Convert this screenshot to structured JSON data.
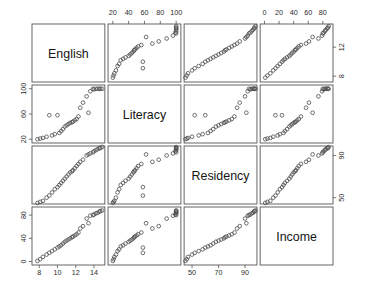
{
  "figure": {
    "type": "scatterplot-matrix",
    "background": "#ffffff",
    "point_color": "#4d4d4d",
    "frame_color": "#555555",
    "point_symbol": "open-circle"
  },
  "chart_data": {
    "type": "scatter",
    "title": "",
    "subtitle": "",
    "xlabel": "",
    "ylabel": "",
    "grid": false,
    "legend": "none",
    "matrix": true,
    "n_variables": 4,
    "n_points": 32,
    "variables": [
      {
        "name": "English",
        "ticks": [
          8,
          10,
          12,
          14
        ],
        "range": [
          7.2,
          15.2
        ],
        "axis_sides": [
          "bottom",
          "right"
        ]
      },
      {
        "name": "Literacy",
        "ticks": [
          20,
          40,
          60,
          80,
          100
        ],
        "range": [
          14,
          106
        ],
        "axis_sides": [
          "top",
          "left"
        ]
      },
      {
        "name": "Residency",
        "ticks": [
          50,
          70,
          90
        ],
        "range": [
          44,
          99
        ],
        "axis_sides": [
          "bottom",
          "right"
        ]
      },
      {
        "name": "Income",
        "ticks": [
          0,
          20,
          40,
          60,
          80
        ],
        "range": [
          -6,
          94
        ],
        "axis_sides": [
          "top",
          "left"
        ]
      }
    ],
    "columns": [
      "English",
      "Literacy",
      "Residency",
      "Income"
    ],
    "rows": [
      "English",
      "Literacy",
      "Residency",
      "Income"
    ],
    "observations": [
      {
        "English": 14.6,
        "Literacy": 100,
        "Residency": 97,
        "Income": 86
      },
      {
        "English": 14.4,
        "Literacy": 100,
        "Residency": 96,
        "Income": 84
      },
      {
        "English": 14.9,
        "Literacy": 100,
        "Residency": 98,
        "Income": 88
      },
      {
        "English": 14.2,
        "Literacy": 100,
        "Residency": 95,
        "Income": 83
      },
      {
        "English": 14.7,
        "Literacy": 100,
        "Residency": 97,
        "Income": 87
      },
      {
        "English": 14.0,
        "Literacy": 99,
        "Residency": 94,
        "Income": 81
      },
      {
        "English": 13.6,
        "Literacy": 96,
        "Residency": 92,
        "Income": 79
      },
      {
        "English": 13.9,
        "Literacy": 100,
        "Residency": 93,
        "Income": 80
      },
      {
        "English": 13.2,
        "Literacy": 88,
        "Residency": 90,
        "Income": 74
      },
      {
        "English": 13.4,
        "Literacy": 62,
        "Residency": 91,
        "Income": 66
      },
      {
        "English": 12.8,
        "Literacy": 78,
        "Residency": 86,
        "Income": 61
      },
      {
        "English": 12.5,
        "Literacy": 70,
        "Residency": 84,
        "Income": 57
      },
      {
        "English": 12.3,
        "Literacy": 56,
        "Residency": 82,
        "Income": 50
      },
      {
        "English": 12.1,
        "Literacy": 52,
        "Residency": 80,
        "Income": 47
      },
      {
        "English": 11.9,
        "Literacy": 50,
        "Residency": 78,
        "Income": 45
      },
      {
        "English": 11.7,
        "Literacy": 48,
        "Residency": 76,
        "Income": 43
      },
      {
        "English": 11.6,
        "Literacy": 47,
        "Residency": 75,
        "Income": 42
      },
      {
        "English": 11.4,
        "Literacy": 46,
        "Residency": 74,
        "Income": 40
      },
      {
        "English": 11.2,
        "Literacy": 44,
        "Residency": 72,
        "Income": 38
      },
      {
        "English": 11.0,
        "Literacy": 42,
        "Residency": 70,
        "Income": 36
      },
      {
        "English": 10.8,
        "Literacy": 40,
        "Residency": 68,
        "Income": 34
      },
      {
        "English": 10.6,
        "Literacy": 36,
        "Residency": 66,
        "Income": 31
      },
      {
        "English": 10.4,
        "Literacy": 33,
        "Residency": 64,
        "Income": 28
      },
      {
        "English": 10.2,
        "Literacy": 30,
        "Residency": 62,
        "Income": 26
      },
      {
        "English": 10.0,
        "Literacy": 58,
        "Residency": 60,
        "Income": 24
      },
      {
        "English": 9.7,
        "Literacy": 28,
        "Residency": 58,
        "Income": 21
      },
      {
        "English": 9.4,
        "Literacy": 26,
        "Residency": 55,
        "Income": 18
      },
      {
        "English": 9.1,
        "Literacy": 58,
        "Residency": 52,
        "Income": 15
      },
      {
        "English": 8.8,
        "Literacy": 24,
        "Residency": 50,
        "Income": 12
      },
      {
        "English": 8.4,
        "Literacy": 22,
        "Residency": 47,
        "Income": 8
      },
      {
        "English": 8.1,
        "Literacy": 21,
        "Residency": 46,
        "Income": 4
      },
      {
        "English": 7.8,
        "Literacy": 20,
        "Residency": 45,
        "Income": 1
      }
    ],
    "axis_tick_labels": {
      "top_literacy": [
        "20",
        "40",
        "60",
        "80",
        "100"
      ],
      "top_income": [
        "0",
        "20",
        "40",
        "60",
        "80"
      ],
      "left_literacy": [
        "20",
        "60",
        "100"
      ],
      "left_income": [
        "0",
        "40",
        "80"
      ],
      "right_english": [
        "8",
        "10",
        "14"
      ],
      "right_residency": [
        "50",
        "70",
        "90"
      ],
      "bottom_english": [
        "8",
        "10",
        "12",
        "14"
      ],
      "bottom_residency": [
        "50",
        "70",
        "90"
      ]
    }
  }
}
